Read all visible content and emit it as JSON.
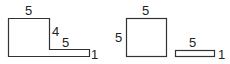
{
  "diagram": {
    "composite_shape": {
      "labels": {
        "top": "5",
        "step_height": "4",
        "step_width": "5",
        "bottom_height": "1"
      }
    },
    "square": {
      "labels": {
        "top": "5",
        "left": "5"
      }
    },
    "thin_rectangle": {
      "labels": {
        "top": "5",
        "right": "1"
      }
    },
    "colors": {
      "stroke": "#333333",
      "text": "#222222",
      "background": "#ffffff"
    }
  }
}
